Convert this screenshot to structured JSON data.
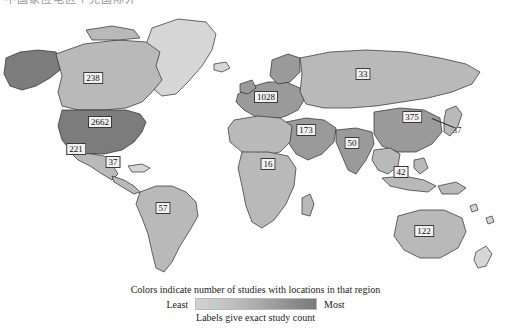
{
  "top_caption": {
    "text": "中国家应电区个克国际外"
  },
  "chart_data": {
    "type": "map",
    "title": "",
    "legend_title": "Colors indicate number of studies with locations in that region",
    "legend_sub": "Labels give exact study count",
    "scale_low_label": "Least",
    "scale_high_label": "Most",
    "colorbar": [
      "#d3d3d3",
      "#c2c2c2",
      "#a8a8a8",
      "#8f8f8f",
      "#7b7b7b"
    ],
    "regions": [
      {
        "name": "United States",
        "value": "2662",
        "x": 100,
        "y": 122,
        "boxed": true
      },
      {
        "name": "Canada",
        "value": "238",
        "x": 93,
        "y": 78,
        "boxed": true
      },
      {
        "name": "Mexico",
        "value": "221",
        "x": 76,
        "y": 149,
        "boxed": true
      },
      {
        "name": "Central America",
        "value": "37",
        "x": 113,
        "y": 162,
        "boxed": true
      },
      {
        "name": "South America",
        "value": "57",
        "x": 163,
        "y": 208,
        "boxed": true
      },
      {
        "name": "Europe",
        "value": "1028",
        "x": 266,
        "y": 97,
        "boxed": true
      },
      {
        "name": "Russia",
        "value": "33",
        "x": 363,
        "y": 74,
        "boxed": true
      },
      {
        "name": "Middle East",
        "value": "173",
        "x": 306,
        "y": 130,
        "boxed": true
      },
      {
        "name": "Africa",
        "value": "16",
        "x": 268,
        "y": 164,
        "boxed": true
      },
      {
        "name": "South Asia",
        "value": "50",
        "x": 352,
        "y": 143,
        "boxed": true
      },
      {
        "name": "China",
        "value": "375",
        "x": 412,
        "y": 117,
        "boxed": true
      },
      {
        "name": "Japan",
        "value": "37",
        "x": 457,
        "y": 130,
        "boxed": false
      },
      {
        "name": "Southeast Asia",
        "value": "42",
        "x": 401,
        "y": 172,
        "boxed": true
      },
      {
        "name": "Australia",
        "value": "122",
        "x": 424,
        "y": 231,
        "boxed": true
      }
    ]
  }
}
